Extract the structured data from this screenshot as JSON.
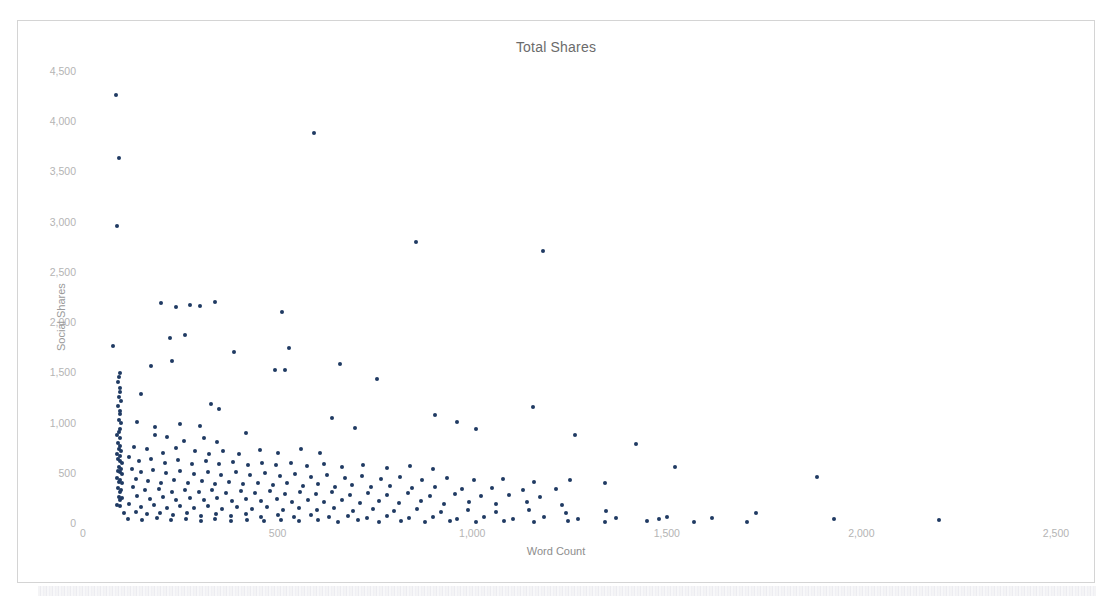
{
  "chart_data": {
    "type": "scatter",
    "title": "Total Shares",
    "xlabel": "Word Count",
    "ylabel": "Social Shares",
    "xlim": [
      0,
      2600
    ],
    "ylim": [
      0,
      4600
    ],
    "xticks": [
      "0",
      "500",
      "1,000",
      "1,500",
      "2,000",
      "2,500"
    ],
    "xtick_values": [
      0,
      500,
      1000,
      1500,
      2000,
      2500
    ],
    "yticks": [
      "0",
      "500",
      "1,000",
      "1,500",
      "2,000",
      "2,500",
      "3,000",
      "3,500",
      "4,000",
      "4,500"
    ],
    "ytick_values": [
      0,
      500,
      1000,
      1500,
      2000,
      2500,
      3000,
      3500,
      4000,
      4500
    ],
    "grid": false,
    "legend": false,
    "marker_color": "#1f3a63",
    "marker_size": 4,
    "points": [
      [
        85,
        4260
      ],
      [
        92,
        3630
      ],
      [
        88,
        2960
      ],
      [
        594,
        3885
      ],
      [
        856,
        2800
      ],
      [
        1183,
        2710
      ],
      [
        78,
        1760
      ],
      [
        200,
        2190
      ],
      [
        275,
        2170
      ],
      [
        340,
        2200
      ],
      [
        300,
        2160
      ],
      [
        238,
        2150
      ],
      [
        512,
        2100
      ],
      [
        262,
        1870
      ],
      [
        223,
        1845
      ],
      [
        530,
        1745
      ],
      [
        388,
        1700
      ],
      [
        228,
        1610
      ],
      [
        176,
        1560
      ],
      [
        493,
        1520
      ],
      [
        520,
        1520
      ],
      [
        660,
        1580
      ],
      [
        755,
        1430
      ],
      [
        95,
        1495
      ],
      [
        92,
        1450
      ],
      [
        90,
        1400
      ],
      [
        96,
        1345
      ],
      [
        94,
        1300
      ],
      [
        92,
        1255
      ],
      [
        98,
        1215
      ],
      [
        150,
        1285
      ],
      [
        90,
        1165
      ],
      [
        96,
        1120
      ],
      [
        94,
        1085
      ],
      [
        330,
        1185
      ],
      [
        350,
        1130
      ],
      [
        1155,
        1150
      ],
      [
        905,
        1075
      ],
      [
        960,
        1010
      ],
      [
        1010,
        940
      ],
      [
        640,
        1045
      ],
      [
        700,
        950
      ],
      [
        92,
        1030
      ],
      [
        98,
        995
      ],
      [
        140,
        1010
      ],
      [
        186,
        960
      ],
      [
        250,
        990
      ],
      [
        300,
        965
      ],
      [
        420,
        900
      ],
      [
        96,
        940
      ],
      [
        92,
        905
      ],
      [
        88,
        875
      ],
      [
        94,
        845
      ],
      [
        185,
        880
      ],
      [
        215,
        855
      ],
      [
        260,
        820
      ],
      [
        310,
        845
      ],
      [
        345,
        805
      ],
      [
        1265,
        880
      ],
      [
        1420,
        790
      ],
      [
        90,
        800
      ],
      [
        96,
        770
      ],
      [
        92,
        740
      ],
      [
        98,
        715
      ],
      [
        130,
        760
      ],
      [
        165,
        735
      ],
      [
        205,
        700
      ],
      [
        240,
        745
      ],
      [
        288,
        715
      ],
      [
        325,
        690
      ],
      [
        360,
        720
      ],
      [
        400,
        690
      ],
      [
        455,
        730
      ],
      [
        500,
        700
      ],
      [
        560,
        735
      ],
      [
        610,
        700
      ],
      [
        88,
        690
      ],
      [
        94,
        665
      ],
      [
        90,
        640
      ],
      [
        96,
        620
      ],
      [
        100,
        600
      ],
      [
        118,
        655
      ],
      [
        145,
        615
      ],
      [
        175,
        640
      ],
      [
        210,
        600
      ],
      [
        245,
        625
      ],
      [
        280,
        590
      ],
      [
        315,
        615
      ],
      [
        350,
        585
      ],
      [
        385,
        605
      ],
      [
        425,
        580
      ],
      [
        460,
        600
      ],
      [
        495,
        575
      ],
      [
        535,
        595
      ],
      [
        575,
        565
      ],
      [
        620,
        585
      ],
      [
        665,
        560
      ],
      [
        720,
        580
      ],
      [
        780,
        545
      ],
      [
        840,
        570
      ],
      [
        900,
        540
      ],
      [
        1520,
        555
      ],
      [
        1885,
        460
      ],
      [
        92,
        560
      ],
      [
        98,
        540
      ],
      [
        90,
        520
      ],
      [
        94,
        505
      ],
      [
        100,
        490
      ],
      [
        125,
        540
      ],
      [
        150,
        510
      ],
      [
        180,
        525
      ],
      [
        212,
        495
      ],
      [
        248,
        520
      ],
      [
        285,
        490
      ],
      [
        320,
        510
      ],
      [
        355,
        480
      ],
      [
        392,
        505
      ],
      [
        430,
        475
      ],
      [
        468,
        495
      ],
      [
        505,
        465
      ],
      [
        545,
        485
      ],
      [
        585,
        455
      ],
      [
        628,
        475
      ],
      [
        672,
        450
      ],
      [
        718,
        470
      ],
      [
        765,
        440
      ],
      [
        815,
        455
      ],
      [
        870,
        430
      ],
      [
        935,
        450
      ],
      [
        1005,
        425
      ],
      [
        1080,
        440
      ],
      [
        1160,
        410
      ],
      [
        1250,
        430
      ],
      [
        1340,
        395
      ],
      [
        88,
        450
      ],
      [
        96,
        430
      ],
      [
        92,
        410
      ],
      [
        100,
        395
      ],
      [
        135,
        440
      ],
      [
        168,
        415
      ],
      [
        200,
        400
      ],
      [
        235,
        425
      ],
      [
        270,
        395
      ],
      [
        305,
        415
      ],
      [
        340,
        390
      ],
      [
        375,
        405
      ],
      [
        412,
        385
      ],
      [
        450,
        400
      ],
      [
        488,
        375
      ],
      [
        525,
        395
      ],
      [
        565,
        370
      ],
      [
        605,
        385
      ],
      [
        648,
        360
      ],
      [
        692,
        380
      ],
      [
        740,
        355
      ],
      [
        790,
        370
      ],
      [
        845,
        345
      ],
      [
        905,
        360
      ],
      [
        975,
        340
      ],
      [
        1050,
        350
      ],
      [
        1130,
        325
      ],
      [
        1215,
        340
      ],
      [
        90,
        345
      ],
      [
        98,
        330
      ],
      [
        94,
        310
      ],
      [
        128,
        355
      ],
      [
        160,
        325
      ],
      [
        195,
        340
      ],
      [
        228,
        310
      ],
      [
        262,
        330
      ],
      [
        298,
        305
      ],
      [
        332,
        325
      ],
      [
        368,
        300
      ],
      [
        405,
        320
      ],
      [
        442,
        295
      ],
      [
        480,
        315
      ],
      [
        518,
        290
      ],
      [
        558,
        310
      ],
      [
        598,
        285
      ],
      [
        640,
        305
      ],
      [
        685,
        280
      ],
      [
        732,
        300
      ],
      [
        782,
        275
      ],
      [
        835,
        295
      ],
      [
        892,
        270
      ],
      [
        955,
        285
      ],
      [
        1022,
        265
      ],
      [
        1095,
        280
      ],
      [
        1175,
        255
      ],
      [
        92,
        260
      ],
      [
        100,
        245
      ],
      [
        95,
        225
      ],
      [
        140,
        270
      ],
      [
        172,
        240
      ],
      [
        205,
        255
      ],
      [
        240,
        230
      ],
      [
        275,
        250
      ],
      [
        310,
        225
      ],
      [
        345,
        245
      ],
      [
        382,
        220
      ],
      [
        420,
        240
      ],
      [
        458,
        215
      ],
      [
        498,
        235
      ],
      [
        538,
        210
      ],
      [
        578,
        230
      ],
      [
        620,
        205
      ],
      [
        665,
        225
      ],
      [
        712,
        200
      ],
      [
        760,
        220
      ],
      [
        812,
        195
      ],
      [
        868,
        215
      ],
      [
        928,
        190
      ],
      [
        992,
        210
      ],
      [
        1062,
        185
      ],
      [
        1140,
        205
      ],
      [
        1230,
        180
      ],
      [
        88,
        180
      ],
      [
        96,
        165
      ],
      [
        118,
        190
      ],
      [
        148,
        160
      ],
      [
        182,
        175
      ],
      [
        216,
        150
      ],
      [
        250,
        170
      ],
      [
        286,
        145
      ],
      [
        322,
        165
      ],
      [
        358,
        140
      ],
      [
        396,
        160
      ],
      [
        434,
        135
      ],
      [
        474,
        155
      ],
      [
        515,
        130
      ],
      [
        556,
        150
      ],
      [
        600,
        125
      ],
      [
        646,
        145
      ],
      [
        694,
        120
      ],
      [
        745,
        140
      ],
      [
        800,
        115
      ],
      [
        858,
        135
      ],
      [
        920,
        110
      ],
      [
        988,
        130
      ],
      [
        1062,
        105
      ],
      [
        1145,
        125
      ],
      [
        1240,
        100
      ],
      [
        1345,
        120
      ],
      [
        105,
        95
      ],
      [
        135,
        110
      ],
      [
        165,
        85
      ],
      [
        198,
        100
      ],
      [
        232,
        78
      ],
      [
        268,
        95
      ],
      [
        304,
        72
      ],
      [
        342,
        90
      ],
      [
        380,
        68
      ],
      [
        418,
        85
      ],
      [
        458,
        62
      ],
      [
        500,
        80
      ],
      [
        542,
        58
      ],
      [
        586,
        75
      ],
      [
        632,
        55
      ],
      [
        680,
        70
      ],
      [
        730,
        50
      ],
      [
        782,
        68
      ],
      [
        838,
        45
      ],
      [
        898,
        62
      ],
      [
        962,
        42
      ],
      [
        1030,
        58
      ],
      [
        1104,
        40
      ],
      [
        1185,
        55
      ],
      [
        1272,
        38
      ],
      [
        1370,
        52
      ],
      [
        1480,
        35
      ],
      [
        115,
        40
      ],
      [
        152,
        30
      ],
      [
        190,
        45
      ],
      [
        226,
        25
      ],
      [
        264,
        38
      ],
      [
        302,
        22
      ],
      [
        340,
        35
      ],
      [
        380,
        20
      ],
      [
        422,
        32
      ],
      [
        465,
        18
      ],
      [
        510,
        30
      ],
      [
        556,
        16
      ],
      [
        604,
        28
      ],
      [
        654,
        14
      ],
      [
        706,
        26
      ],
      [
        760,
        12
      ],
      [
        818,
        24
      ],
      [
        878,
        10
      ],
      [
        942,
        22
      ],
      [
        1010,
        8
      ],
      [
        1082,
        20
      ],
      [
        1160,
        6
      ],
      [
        1245,
        18
      ],
      [
        1340,
        5
      ],
      [
        1448,
        15
      ],
      [
        1570,
        8
      ],
      [
        1705,
        12
      ],
      [
        1730,
        95
      ],
      [
        1930,
        40
      ],
      [
        2200,
        28
      ],
      [
        1615,
        48
      ],
      [
        1500,
        60
      ]
    ]
  }
}
